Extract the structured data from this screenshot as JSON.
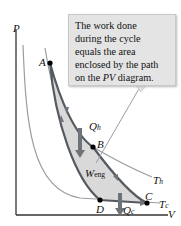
{
  "callout": {
    "line1": "The work done",
    "line2": "during the cycle",
    "line3": "equals the area",
    "line4_pre": "enclosed by the path",
    "line5_pre": "on the ",
    "line5_em": "PV",
    "line5_post": " diagram."
  },
  "axes": {
    "y_label": "P",
    "x_label": "V"
  },
  "points": {
    "a": "A",
    "b": "B",
    "c": "C",
    "d": "D"
  },
  "labels": {
    "qh": "Q",
    "qh_sub": "h",
    "qc": "Q",
    "qc_sub": "c",
    "weng": "W",
    "weng_sub": "eng",
    "th": "T",
    "th_sub": "h",
    "tc": "T",
    "tc_sub": "c"
  },
  "colors": {
    "cycle": "#555a60",
    "isotherm": "#8a8d91",
    "fill": "#d8d8d8",
    "arrow": "#6e737a",
    "callout_bg": "#e4e4e4"
  }
}
